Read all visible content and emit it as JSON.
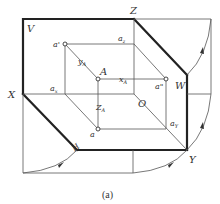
{
  "diagram": {
    "type": "three-plane projection unfolding",
    "caption": "(a)",
    "axis_labels": {
      "X": "X",
      "Y": "Y",
      "Z": "Z",
      "O": "O"
    },
    "plane_labels": {
      "V": "V",
      "H": "H",
      "W": "W"
    },
    "point_labels": {
      "A": "A",
      "a_prime": "a'",
      "a_double_prime": "a\"",
      "a": "a",
      "a_x": "a",
      "a_x_sub": "x",
      "a_z": "a",
      "a_z_sub": "z",
      "a_y": "a",
      "a_y_sub": "Y"
    },
    "coordinate_labels": {
      "x_A": "x",
      "x_A_sub": "A",
      "y_A": "y",
      "y_A_sub": "A",
      "z_A": "Z",
      "z_A_sub": "A"
    },
    "colors": {
      "thick_line": "#222222",
      "thin_line": "#555555",
      "background": "#ffffff"
    }
  }
}
